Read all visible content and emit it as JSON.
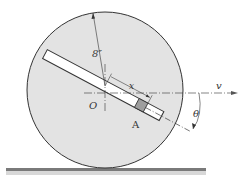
{
  "diagram": {
    "labels": {
      "radius": "8″",
      "x": "x",
      "origin": "O",
      "slider": "A",
      "velocity": "v",
      "angle": "θ"
    },
    "colors": {
      "disk_fill": "#e3e3e3",
      "stroke": "#333333",
      "slider_fill": "#9e9e9e",
      "ground": "#7a7a7a"
    }
  }
}
